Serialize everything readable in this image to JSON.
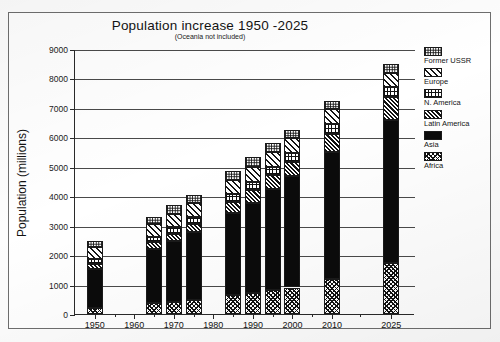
{
  "chart_data": {
    "type": "bar",
    "variant": "stacked-vertical",
    "title": "Population increase 1950 -2025",
    "subtitle": "(Oceania not included)",
    "xlabel": "",
    "ylabel": "Population (millions)",
    "ylim": [
      0,
      9000
    ],
    "ytick_step": 1000,
    "ytick_labels": [
      "9000",
      "8000",
      "7000",
      "6000",
      "5000",
      "4000",
      "3000",
      "2000",
      "1000",
      "0"
    ],
    "ytick_values": [
      9000,
      8000,
      7000,
      6000,
      5000,
      4000,
      3000,
      2000,
      1000,
      0
    ],
    "xtick_labels": [
      "1950",
      "1960",
      "1970",
      "1980",
      "1990",
      "2000",
      "2010",
      "2025"
    ],
    "grid": "horizontal",
    "legend_position": "right",
    "legend_order_top_to_bottom": [
      "Former USSR",
      "Europe",
      "N. America",
      "Latin America",
      "Asia",
      "Africa"
    ],
    "stack_order_bottom_to_top": [
      "Africa",
      "Asia",
      "Latin America",
      "N. America",
      "Europe",
      "Former USSR"
    ],
    "categories": [
      "1950",
      "1965",
      "1970",
      "1975",
      "1985",
      "1990",
      "1995",
      "2000",
      "2010",
      "2025"
    ],
    "totals": [
      2480,
      3300,
      3700,
      4050,
      4850,
      5330,
      5800,
      6250,
      7230,
      8480
    ],
    "series": [
      {
        "name": "Africa",
        "pattern": "crosshatch-dark",
        "values": [
          220,
          370,
          420,
          470,
          650,
          720,
          810,
          900,
          1200,
          1720
        ]
      },
      {
        "name": "Asia",
        "pattern": "solid-black",
        "values": [
          1320,
          1840,
          2050,
          2320,
          2790,
          3060,
          3440,
          3770,
          4300,
          4880
        ]
      },
      {
        "name": "Latin America",
        "pattern": "diagonal-dense",
        "values": [
          170,
          220,
          250,
          280,
          370,
          420,
          460,
          500,
          610,
          760
        ]
      },
      {
        "name": "N. America",
        "pattern": "vertical-grid",
        "values": [
          170,
          200,
          220,
          230,
          260,
          280,
          290,
          310,
          330,
          360
        ]
      },
      {
        "name": "Europe",
        "pattern": "diagonal-light",
        "values": [
          390,
          440,
          460,
          470,
          490,
          500,
          500,
          510,
          520,
          480
        ]
      },
      {
        "name": "Former USSR",
        "pattern": "stipple",
        "values": [
          210,
          230,
          300,
          280,
          290,
          350,
          300,
          260,
          270,
          280
        ]
      }
    ]
  },
  "legend": {
    "items": [
      {
        "label": "Former USSR",
        "pattern": "stipple"
      },
      {
        "label": "Europe",
        "pattern": "diagonal-light"
      },
      {
        "label": "N. America",
        "pattern": "vertical-grid"
      },
      {
        "label": "Latin America",
        "pattern": "diagonal-dense"
      },
      {
        "label": "Asia",
        "pattern": "solid-black"
      },
      {
        "label": "Africa",
        "pattern": "crosshatch-dark"
      }
    ]
  },
  "axis": {
    "x_major_ticks": [
      "1950",
      "1960",
      "1970",
      "1980",
      "1990",
      "2000",
      "2010",
      "2025"
    ]
  }
}
